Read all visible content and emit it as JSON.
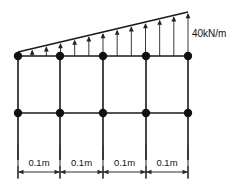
{
  "diagram": {
    "type": "structural-frame-elevation",
    "load": {
      "label": "40kN/m",
      "magnitude": 40,
      "unit": "kN/m",
      "distribution": "linearly-varying-triangular",
      "peak_side": "right",
      "min_value": 0,
      "max_value": 40,
      "direction": "upward",
      "arrow_count": 12,
      "color": "#1a1a1a"
    },
    "geometry": {
      "bay_count": 4,
      "column_count": 5,
      "beam_levels": 2,
      "column_x": [
        18,
        60,
        103,
        146,
        188
      ],
      "top_beam_y": 56,
      "mid_beam_y": 113,
      "column_bottom_y": 160,
      "load_apex_y": 12,
      "load_left_y": 52,
      "joint_radius": 4.2
    },
    "dimensions": {
      "labels": [
        "0.1m",
        "0.1m",
        "0.1m",
        "0.1m"
      ],
      "value": 0.1,
      "unit": "m",
      "line_y": 172,
      "ext_top_y": 145,
      "ext_bottom_y": 179,
      "total_span": "0.4m"
    },
    "style": {
      "stroke": "#1a1a1a",
      "dim_stroke": "#2b2b2b",
      "background": "#ffffff"
    }
  }
}
